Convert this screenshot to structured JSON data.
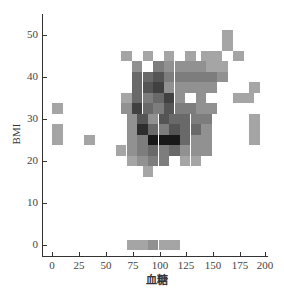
{
  "chart_data": {
    "type": "heatmap",
    "title": "",
    "xlabel": "血糖",
    "ylabel": "BMI",
    "xlim": [
      -8,
      205
    ],
    "ylim": [
      -3,
      55
    ],
    "x_ticks": [
      0,
      25,
      50,
      75,
      100,
      125,
      150,
      175,
      200
    ],
    "y_ticks": [
      0,
      10,
      20,
      30,
      40,
      50
    ],
    "grid": false,
    "legend": null,
    "colormap": "gray (darker = higher count)",
    "bin_width_x": 10,
    "bin_height_y": 2.5,
    "cells": [
      {
        "x": 70,
        "y": 45,
        "v": 3
      },
      {
        "x": 90,
        "y": 45,
        "v": 3
      },
      {
        "x": 110,
        "y": 45,
        "v": 3
      },
      {
        "x": 130,
        "y": 45,
        "v": 3
      },
      {
        "x": 145,
        "y": 45,
        "v": 3
      },
      {
        "x": 165,
        "y": 50,
        "v": 3
      },
      {
        "x": 165,
        "y": 47.5,
        "v": 3
      },
      {
        "x": 155,
        "y": 45,
        "v": 3
      },
      {
        "x": 175,
        "y": 45,
        "v": 3
      },
      {
        "x": 80,
        "y": 42.5,
        "v": 4
      },
      {
        "x": 100,
        "y": 42.5,
        "v": 5
      },
      {
        "x": 110,
        "y": 42.5,
        "v": 4
      },
      {
        "x": 120,
        "y": 42.5,
        "v": 4
      },
      {
        "x": 130,
        "y": 42.5,
        "v": 4
      },
      {
        "x": 140,
        "y": 42.5,
        "v": 4
      },
      {
        "x": 150,
        "y": 42.5,
        "v": 3
      },
      {
        "x": 160,
        "y": 42.5,
        "v": 3
      },
      {
        "x": 80,
        "y": 40,
        "v": 6
      },
      {
        "x": 90,
        "y": 40,
        "v": 6
      },
      {
        "x": 100,
        "y": 40,
        "v": 7
      },
      {
        "x": 110,
        "y": 40,
        "v": 5
      },
      {
        "x": 120,
        "y": 40,
        "v": 5
      },
      {
        "x": 130,
        "y": 40,
        "v": 5
      },
      {
        "x": 140,
        "y": 40,
        "v": 5
      },
      {
        "x": 150,
        "y": 40,
        "v": 5
      },
      {
        "x": 160,
        "y": 40,
        "v": 4
      },
      {
        "x": 80,
        "y": 37.5,
        "v": 6
      },
      {
        "x": 90,
        "y": 37.5,
        "v": 7
      },
      {
        "x": 100,
        "y": 37.5,
        "v": 8
      },
      {
        "x": 110,
        "y": 37.5,
        "v": 4
      },
      {
        "x": 120,
        "y": 37.5,
        "v": 4
      },
      {
        "x": 130,
        "y": 37.5,
        "v": 4
      },
      {
        "x": 140,
        "y": 37.5,
        "v": 4
      },
      {
        "x": 150,
        "y": 37.5,
        "v": 4
      },
      {
        "x": 190,
        "y": 37.5,
        "v": 3
      },
      {
        "x": 70,
        "y": 35,
        "v": 3
      },
      {
        "x": 80,
        "y": 35,
        "v": 6
      },
      {
        "x": 90,
        "y": 35,
        "v": 5
      },
      {
        "x": 100,
        "y": 35,
        "v": 6
      },
      {
        "x": 110,
        "y": 35,
        "v": 8
      },
      {
        "x": 120,
        "y": 35,
        "v": 4
      },
      {
        "x": 140,
        "y": 35,
        "v": 4
      },
      {
        "x": 175,
        "y": 35,
        "v": 3
      },
      {
        "x": 185,
        "y": 35,
        "v": 3
      },
      {
        "x": 5,
        "y": 32.5,
        "v": 3
      },
      {
        "x": 70,
        "y": 32.5,
        "v": 4
      },
      {
        "x": 80,
        "y": 32.5,
        "v": 8
      },
      {
        "x": 90,
        "y": 32.5,
        "v": 6
      },
      {
        "x": 100,
        "y": 32.5,
        "v": 5
      },
      {
        "x": 110,
        "y": 32.5,
        "v": 7
      },
      {
        "x": 120,
        "y": 32.5,
        "v": 5
      },
      {
        "x": 130,
        "y": 32.5,
        "v": 5
      },
      {
        "x": 140,
        "y": 32.5,
        "v": 4
      },
      {
        "x": 150,
        "y": 32.5,
        "v": 4
      },
      {
        "x": 75,
        "y": 30,
        "v": 4
      },
      {
        "x": 85,
        "y": 30,
        "v": 7
      },
      {
        "x": 95,
        "y": 30,
        "v": 4
      },
      {
        "x": 105,
        "y": 30,
        "v": 7
      },
      {
        "x": 115,
        "y": 30,
        "v": 6
      },
      {
        "x": 125,
        "y": 30,
        "v": 6
      },
      {
        "x": 135,
        "y": 30,
        "v": 5
      },
      {
        "x": 145,
        "y": 30,
        "v": 5
      },
      {
        "x": 190,
        "y": 30,
        "v": 3
      },
      {
        "x": 5,
        "y": 27.5,
        "v": 3
      },
      {
        "x": 75,
        "y": 27.5,
        "v": 4
      },
      {
        "x": 85,
        "y": 27.5,
        "v": 9
      },
      {
        "x": 95,
        "y": 27.5,
        "v": 6
      },
      {
        "x": 105,
        "y": 27.5,
        "v": 5
      },
      {
        "x": 115,
        "y": 27.5,
        "v": 7
      },
      {
        "x": 125,
        "y": 27.5,
        "v": 6
      },
      {
        "x": 135,
        "y": 27.5,
        "v": 6
      },
      {
        "x": 145,
        "y": 27.5,
        "v": 4
      },
      {
        "x": 190,
        "y": 27.5,
        "v": 3
      },
      {
        "x": 35,
        "y": 25,
        "v": 3
      },
      {
        "x": 5,
        "y": 25,
        "v": 3
      },
      {
        "x": 75,
        "y": 25,
        "v": 4
      },
      {
        "x": 85,
        "y": 25,
        "v": 5
      },
      {
        "x": 95,
        "y": 25,
        "v": 10
      },
      {
        "x": 105,
        "y": 25,
        "v": 10
      },
      {
        "x": 115,
        "y": 25,
        "v": 10
      },
      {
        "x": 125,
        "y": 25,
        "v": 6
      },
      {
        "x": 135,
        "y": 25,
        "v": 4
      },
      {
        "x": 145,
        "y": 25,
        "v": 4
      },
      {
        "x": 190,
        "y": 25,
        "v": 3
      },
      {
        "x": 65,
        "y": 22.5,
        "v": 3
      },
      {
        "x": 75,
        "y": 22.5,
        "v": 4
      },
      {
        "x": 85,
        "y": 22.5,
        "v": 5
      },
      {
        "x": 95,
        "y": 22.5,
        "v": 6
      },
      {
        "x": 105,
        "y": 22.5,
        "v": 5
      },
      {
        "x": 115,
        "y": 22.5,
        "v": 6
      },
      {
        "x": 125,
        "y": 22.5,
        "v": 4
      },
      {
        "x": 135,
        "y": 22.5,
        "v": 4
      },
      {
        "x": 145,
        "y": 22.5,
        "v": 4
      },
      {
        "x": 75,
        "y": 20,
        "v": 3
      },
      {
        "x": 85,
        "y": 20,
        "v": 4
      },
      {
        "x": 95,
        "y": 20,
        "v": 5
      },
      {
        "x": 105,
        "y": 20,
        "v": 5
      },
      {
        "x": 125,
        "y": 20,
        "v": 3
      },
      {
        "x": 135,
        "y": 20,
        "v": 3
      },
      {
        "x": 90,
        "y": 17.5,
        "v": 3
      },
      {
        "x": 75,
        "y": 0,
        "v": 3
      },
      {
        "x": 85,
        "y": 0,
        "v": 3
      },
      {
        "x": 95,
        "y": 0,
        "v": 4
      },
      {
        "x": 105,
        "y": 0,
        "v": 3
      },
      {
        "x": 115,
        "y": 0,
        "v": 3
      }
    ]
  },
  "axes": {
    "xlabel": "血糖",
    "ylabel": "BMI",
    "x_ticks": [
      {
        "label": "0",
        "px": 52
      },
      {
        "label": "25",
        "px": 79
      },
      {
        "label": "50",
        "px": 106
      },
      {
        "label": "75",
        "px": 133
      },
      {
        "label": "100",
        "px": 160
      },
      {
        "label": "125",
        "px": 186
      },
      {
        "label": "150",
        "px": 213
      },
      {
        "label": "175",
        "px": 240
      },
      {
        "label": "200",
        "px": 265
      }
    ],
    "y_ticks": [
      {
        "label": "50",
        "py": 35
      },
      {
        "label": "40",
        "py": 77
      },
      {
        "label": "30",
        "py": 119
      },
      {
        "label": "20",
        "py": 161
      },
      {
        "label": "10",
        "py": 203
      },
      {
        "label": "0",
        "py": 245
      }
    ]
  }
}
